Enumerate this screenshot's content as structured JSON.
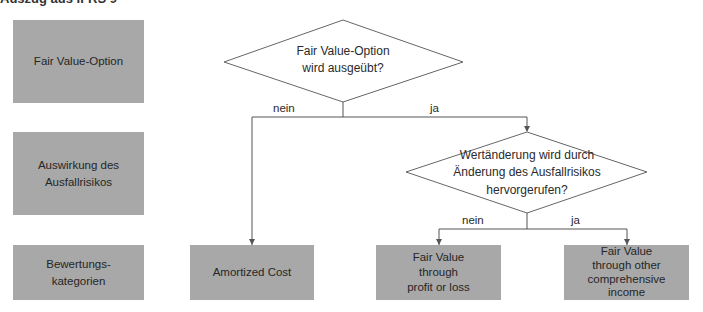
{
  "header": {
    "title": "Auszug aus IFRS 9"
  },
  "row_labels": [
    {
      "label": "Fair Value-Option"
    },
    {
      "label": "Auswirkung des\nAusfallrisikos"
    },
    {
      "label": "Bewertungs-\nkategorien"
    }
  ],
  "decisions": [
    {
      "question": "Fair Value-Option\nwird ausgeübt?",
      "no_label": "nein",
      "yes_label": "ja"
    },
    {
      "question": "Wertänderung wird durch\nÄnderung des Ausfallrisikos\nhervorgerufen?",
      "no_label": "nein",
      "yes_label": "ja"
    }
  ],
  "outcomes": [
    {
      "label": "Amortized Cost"
    },
    {
      "label": "Fair Value\nthrough\nprofit or loss"
    },
    {
      "label": "Fair Value\nthrough other\ncomprehensive\nincome"
    }
  ],
  "colors": {
    "box_fill": "#a8a8a8",
    "line": "#555555"
  }
}
